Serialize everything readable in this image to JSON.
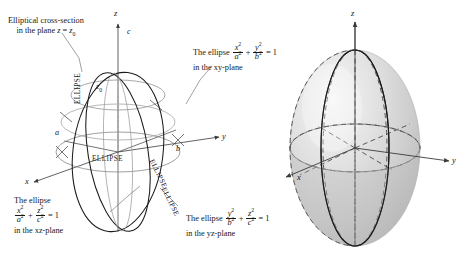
{
  "figure": {
    "background": "#ffffff",
    "ink": "#181818",
    "axis_color": "#3a3a3a",
    "curve_color": "#1b1b1b",
    "light_curve_color": "#9a9a9a",
    "surface_fill": "#d8d8d8",
    "surface_highlight": "#f2f2f2"
  },
  "left_diagram": {
    "name": "wireframe-ellipsoid",
    "axes": {
      "x": "x",
      "y": "y",
      "z": "z"
    },
    "intercepts": {
      "x_semiaxis": "a",
      "y_semiaxis": "b",
      "z_semiaxis": "c"
    },
    "cross_section_height": "z0",
    "curve_labels": [
      {
        "text": "ELLIPSE",
        "placement": "xy-plane-front"
      },
      {
        "text": "ELLIPSE",
        "placement": "xz-plane-vertical"
      },
      {
        "text": "ELLIPSE",
        "placement": "yz-plane-right"
      },
      {
        "text": "ELLIPSE",
        "placement": "yz-plane-lower-right"
      }
    ],
    "annotations": {
      "cross_section": {
        "line1": "Elliptical cross-section",
        "line2_prefix": "in the plane ",
        "line2_var": "z",
        "line2_eq": " = ",
        "line2_val": "z",
        "line2_sub": "0"
      },
      "xy_plane": {
        "lead": "The ellipse",
        "eq_num1": "x",
        "eq_den1": "a",
        "eq_num2": "y",
        "eq_den2": "b",
        "eq_rhs": "= 1",
        "tail": "in the xy-plane"
      },
      "xz_plane": {
        "lead": "The ellipse",
        "eq_num1": "x",
        "eq_den1": "a",
        "eq_num2": "z",
        "eq_den2": "c",
        "eq_rhs": "= 1",
        "tail": "in the xz-plane"
      },
      "yz_plane": {
        "lead": "The ellipse",
        "eq_num1": "y",
        "eq_den1": "b",
        "eq_num2": "z",
        "eq_den2": "c",
        "eq_rhs": "= 1",
        "tail": "in the yz-plane"
      }
    },
    "exponent": "2",
    "plus": "+"
  },
  "right_diagram": {
    "name": "shaded-ellipsoid",
    "axes": {
      "x": "x",
      "y": "y",
      "z": "z"
    },
    "style": "shaded solid with dashed hidden trace curves"
  }
}
